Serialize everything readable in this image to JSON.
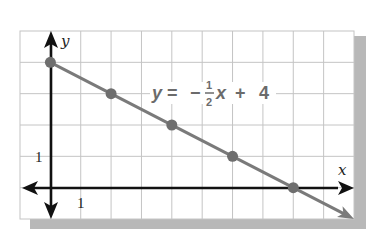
{
  "chart_data": {
    "type": "line",
    "title": "",
    "equation": {
      "lhs": "y",
      "equals": "=",
      "minus": "−",
      "numerator": "1",
      "denominator": "2",
      "var": "x",
      "plus": "+",
      "constant": "4"
    },
    "xlabel": "x",
    "ylabel": "y",
    "x_tick_label": "1",
    "y_tick_label": "1",
    "xlim": [
      -1,
      10
    ],
    "ylim": [
      -1,
      5
    ],
    "grid": true,
    "series": [
      {
        "name": "y = -1/2 x + 4",
        "slope": -0.5,
        "intercept": 4,
        "points": [
          {
            "x": 0,
            "y": 4
          },
          {
            "x": 2,
            "y": 3
          },
          {
            "x": 4,
            "y": 2
          },
          {
            "x": 6,
            "y": 1
          },
          {
            "x": 8,
            "y": 0
          }
        ],
        "line_extends_to": {
          "x": 10,
          "y": -1
        }
      }
    ],
    "colors": {
      "line": "#7a7a7a",
      "points": "#6e6e6e",
      "axes": "#111111",
      "grid": "#bdbdbd",
      "shadow": "#b8b8b8",
      "equation": "#6b6b6b"
    }
  }
}
